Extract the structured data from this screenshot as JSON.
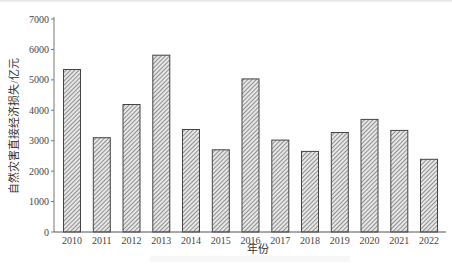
{
  "chart_data": {
    "type": "bar",
    "title": "",
    "xlabel": "年份",
    "ylabel": "自然灾害直接经济损失/亿元",
    "categories": [
      "2010",
      "2011",
      "2012",
      "2013",
      "2014",
      "2015",
      "2016",
      "2017",
      "2018",
      "2019",
      "2020",
      "2021",
      "2022"
    ],
    "values": [
      5340,
      3100,
      4190,
      5810,
      3370,
      2700,
      5030,
      3020,
      2650,
      3270,
      3700,
      3340,
      2390
    ],
    "ylim": [
      0,
      7000
    ],
    "yticks": [
      0,
      1000,
      2000,
      3000,
      4000,
      5000,
      6000,
      7000
    ],
    "grid": false,
    "legend": null,
    "bar_style": "diagonal hatch, dark outline"
  },
  "axes": {
    "xlabel": "年份",
    "ylabel": "自然灾害直接经济损失/亿元",
    "ytick_labels": [
      "0",
      "1000",
      "2000",
      "3000",
      "4000",
      "5000",
      "6000",
      "7000"
    ]
  }
}
